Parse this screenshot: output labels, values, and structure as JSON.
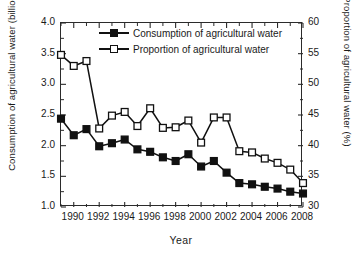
{
  "chart_data": {
    "type": "line",
    "title": "",
    "xlabel": "Year",
    "ylabel": "Consumption of agricultural water (billion m3)",
    "ylabel_right": "Proportion of agricultural water (%)",
    "x": [
      1989,
      1990,
      1991,
      1992,
      1993,
      1994,
      1995,
      1996,
      1997,
      1998,
      1999,
      2000,
      2001,
      2002,
      2003,
      2004,
      2005,
      2006,
      2007,
      2008
    ],
    "xlim": [
      1989,
      2008
    ],
    "xticks": [
      1990,
      1992,
      1994,
      1996,
      1998,
      2000,
      2002,
      2004,
      2006,
      2008
    ],
    "xtick_labels": [
      "1990",
      "1992",
      "1994",
      "1996",
      "1998",
      "2000",
      "2002",
      "2004",
      "2006",
      "2008"
    ],
    "xminor_ticks": [
      1989,
      1991,
      1993,
      1995,
      1997,
      1999,
      2001,
      2003,
      2005,
      2007
    ],
    "ylim": [
      1.0,
      4.0
    ],
    "yticks": [
      1.0,
      1.5,
      2.0,
      2.5,
      3.0,
      3.5,
      4.0
    ],
    "ytick_labels": [
      "1.0",
      "1.5",
      "2.0",
      "2.5",
      "3.0",
      "3.5",
      "4.0"
    ],
    "ylim_right": [
      30,
      60
    ],
    "yticks_right": [
      30,
      35,
      40,
      45,
      50,
      55,
      60
    ],
    "ytick_labels_right": [
      "30",
      "35",
      "40",
      "45",
      "50",
      "55",
      "60"
    ],
    "grid": false,
    "legend_position": "top-center",
    "series": [
      {
        "name": "Consumption of agricultural water",
        "axis": "left",
        "marker": "filled-square",
        "color": "#111111",
        "values": [
          2.44,
          2.17,
          2.27,
          1.99,
          2.04,
          2.1,
          1.94,
          1.9,
          1.81,
          1.75,
          1.86,
          1.66,
          1.75,
          1.56,
          1.39,
          1.37,
          1.33,
          1.3,
          1.25,
          1.22
        ]
      },
      {
        "name": "Proportion of agricultural water",
        "axis": "right",
        "marker": "open-square",
        "color": "#111111",
        "values": [
          54.8,
          53.0,
          53.8,
          42.8,
          44.9,
          45.5,
          43.2,
          46.1,
          42.9,
          43.0,
          44.1,
          40.5,
          44.6,
          44.6,
          39.1,
          38.9,
          37.9,
          37.2,
          36.1,
          33.9
        ]
      }
    ]
  },
  "axes": {
    "left_label_main": "Consumption of agricultural water (billion m",
    "left_label_sup": "3",
    "left_label_tail": ")",
    "right_label": "Proportion of agricultural water (%)",
    "x_label": "Year"
  },
  "legend": {
    "items": [
      {
        "label": "Consumption of agricultural water",
        "marker": "filled-square"
      },
      {
        "label": "Proportion of agricultural water",
        "marker": "open-square"
      }
    ]
  }
}
